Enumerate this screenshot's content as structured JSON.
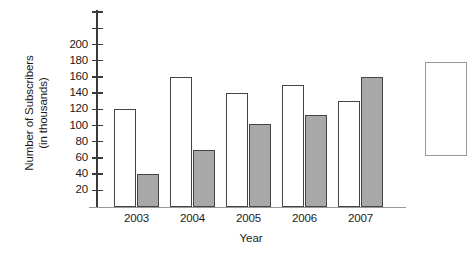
{
  "chart_data": {
    "type": "bar",
    "title": "",
    "xlabel": "Year",
    "ylabel": "Number of Subscribers (in thousands)",
    "ylabel_line1": "Number of Subscribers",
    "ylabel_line2": "(in thousands)",
    "categories": [
      "2003",
      "2004",
      "2005",
      "2006",
      "2007"
    ],
    "series": [
      {
        "name": "Series 1",
        "color": "#ffffff",
        "values": [
          120,
          160,
          140,
          150,
          130
        ]
      },
      {
        "name": "Series 2",
        "color": "#a8a8a8",
        "values": [
          40,
          70,
          102,
          113,
          160
        ]
      }
    ],
    "ylim": [
      0,
      200
    ],
    "ytick_values": [
      20,
      40,
      60,
      80,
      100,
      120,
      140,
      160,
      180,
      200
    ],
    "ytick_labels": [
      "20",
      "40",
      "60",
      "80",
      "100",
      "120",
      "140",
      "160",
      "180",
      "200"
    ],
    "extra_ticks_above_axis": 2,
    "grid": false,
    "legend_position": "right-cropped"
  },
  "colors": {
    "bar_white_fill": "#ffffff",
    "bar_gray_fill": "#a8a8a8",
    "bar_outline": "#454545",
    "axis": "#3a3a3a",
    "baseline": "#9a9a9a",
    "text": "#1a1a1a"
  },
  "title_remnant": "."
}
